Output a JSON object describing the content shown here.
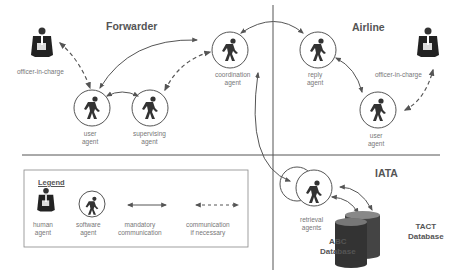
{
  "sections": {
    "forwarder": "Forwarder",
    "airline": "Airline",
    "iata": "IATA"
  },
  "agents": {
    "forwarder_officer": "officer-in-charge",
    "forwarder_user_1": "user",
    "forwarder_user_2": "agent",
    "supervising_1": "supervising",
    "supervising_2": "agent",
    "coordination_1": "coordination",
    "coordination_2": "agent",
    "reply_1": "reply",
    "reply_2": "agent",
    "airline_officer": "officer-in-charge",
    "airline_user_1": "user",
    "airline_user_2": "agent",
    "retrieval_1": "retrieval",
    "retrieval_2": "agents"
  },
  "databases": {
    "abc_1": "ABC",
    "abc_2": "Database",
    "tact_1": "TACT",
    "tact_2": "Database"
  },
  "legend": {
    "title": "Legend",
    "human_1": "human",
    "human_2": "agent",
    "software_1": "software",
    "software_2": "agent",
    "mandatory_1": "mandatory",
    "mandatory_2": "communication",
    "optional_1": "communication",
    "optional_2": "if necessary"
  },
  "colors": {
    "line": "#555555",
    "figure": "#333333",
    "label": "#777777"
  }
}
